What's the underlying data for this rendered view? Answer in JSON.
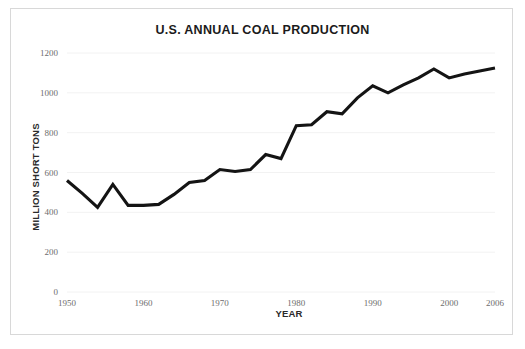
{
  "figure": {
    "title": "U.S. ANNUAL COAL PRODUCTION",
    "xlabel": "YEAR",
    "ylabel": "MILLION SHORT TONS",
    "line_color": "#141414",
    "grid_color": "#f2f2f2",
    "background_color": "#ffffff",
    "border_color": "#d8d8d8",
    "tick_label_color": "#6d6d6d"
  },
  "chart_data": {
    "type": "line",
    "title": "U.S. ANNUAL COAL PRODUCTION",
    "xlabel": "YEAR",
    "ylabel": "MILLION SHORT TONS",
    "xlim": [
      1950,
      2006
    ],
    "ylim": [
      0,
      1200
    ],
    "grid": true,
    "grid_axis": "y",
    "legend": false,
    "legend_position": "none",
    "xticks": [
      1950,
      1960,
      1970,
      1980,
      1990,
      2000,
      2006
    ],
    "xticklabels": [
      "1950",
      "1960",
      "1970",
      "1980",
      "1990",
      "2000",
      "2006"
    ],
    "yticks": [
      0,
      200,
      400,
      600,
      800,
      1000,
      1200
    ],
    "yticklabels": [
      "0",
      "200",
      "400",
      "600",
      "800",
      "1000",
      "1200"
    ],
    "series": [
      {
        "name": "U.S. annual coal production",
        "units": "million short tons",
        "x": [
          1950,
          1952,
          1954,
          1956,
          1958,
          1960,
          1962,
          1964,
          1966,
          1968,
          1970,
          1972,
          1974,
          1976,
          1978,
          1980,
          1982,
          1984,
          1986,
          1988,
          1990,
          1992,
          1994,
          1996,
          1998,
          2000,
          2002,
          2004,
          2006
        ],
        "values": [
          560,
          495,
          425,
          540,
          435,
          435,
          440,
          490,
          550,
          560,
          615,
          605,
          615,
          690,
          670,
          835,
          840,
          905,
          895,
          975,
          1035,
          1000,
          1040,
          1075,
          1120,
          1075,
          1095,
          1110,
          1125
        ]
      }
    ]
  },
  "axes": {
    "x_tick_labels": [
      "1950",
      "1960",
      "1970",
      "1980",
      "1990",
      "2000",
      "2006"
    ],
    "y_tick_labels": [
      "1200",
      "1000",
      "800",
      "600",
      "400",
      "200",
      "0"
    ]
  }
}
